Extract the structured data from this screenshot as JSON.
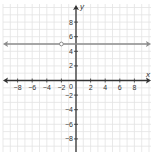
{
  "chart_data": {
    "type": "line",
    "title": "",
    "xlabel": "x",
    "ylabel": "y",
    "xlim": [
      -10,
      10
    ],
    "ylim": [
      -10,
      10
    ],
    "grid": true,
    "x_ticks": [
      -8,
      -6,
      -4,
      -2,
      2,
      4,
      6,
      8
    ],
    "y_ticks": [
      8,
      6,
      4,
      2,
      -2,
      -4,
      -6,
      -8
    ],
    "x_tick_labels": [
      "−8",
      "−6",
      "−4",
      "−2",
      "2",
      "4",
      "6",
      "8"
    ],
    "y_tick_labels": [
      "8",
      "6",
      "4",
      "2",
      "−2",
      "−4",
      "−6",
      "−8"
    ],
    "origin_label": "0",
    "series": [
      {
        "name": "y = 5 (x ≠ −2)",
        "type": "horizontal-line",
        "y": 5,
        "x_range": [
          -10,
          10
        ],
        "arrows": "both",
        "color": "#8c8c8c",
        "open_points": [
          {
            "x": -2,
            "y": 5
          }
        ]
      }
    ],
    "legend": "none"
  },
  "colors": {
    "grid": "#e3e3e3",
    "axis": "#333333",
    "line": "#8c8c8c",
    "label": "#333333"
  }
}
